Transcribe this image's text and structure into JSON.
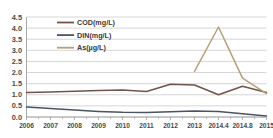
{
  "chart_data": {
    "type": "line",
    "title": "",
    "subtitle": "",
    "xlabel": "",
    "ylabel": "",
    "grid": "horizontal",
    "legend_position": "top-left-inside",
    "x": [
      "2006",
      "2007",
      "2008",
      "2009",
      "2010",
      "2011",
      "2012",
      "2013",
      "2014.4",
      "2014.8",
      "2015"
    ],
    "categories": [
      "2006",
      "2007",
      "2008",
      "2009",
      "2010",
      "2011",
      "2012",
      "2013",
      "2014.4",
      "2014.8",
      "2015"
    ],
    "ylim": [
      0.0,
      4.5
    ],
    "yticks": [
      "0.0",
      "0.5",
      "1.0",
      "1.5",
      "2.0",
      "2.5",
      "3.0",
      "3.5",
      "4.0",
      "4.5"
    ],
    "ytick_values": [
      0.0,
      0.5,
      1.0,
      1.5,
      2.0,
      2.5,
      3.0,
      3.5,
      4.0,
      4.5
    ],
    "series": [
      {
        "name": "COD(mg/L)",
        "color": "#6b4a3f",
        "values": [
          1.1,
          1.13,
          1.16,
          1.19,
          1.22,
          1.15,
          1.47,
          1.44,
          1.0,
          1.38,
          1.1
        ]
      },
      {
        "name": "DIN(mg/L)",
        "color": "#3f4a5c",
        "values": [
          0.45,
          0.38,
          0.31,
          0.25,
          0.21,
          0.2,
          0.24,
          0.27,
          0.25,
          0.15,
          0.05
        ]
      },
      {
        "name": "As(µg/L)",
        "color": "#b39a75",
        "values": [
          null,
          null,
          null,
          null,
          null,
          null,
          null,
          2.05,
          4.05,
          1.75,
          1.05
        ]
      }
    ]
  },
  "legend": {
    "items": [
      {
        "label": "COD(mg/L)",
        "color": "#6b4a3f"
      },
      {
        "label": "DIN(mg/L)",
        "color": "#3f4a5c"
      },
      {
        "label": "As(µg/L)",
        "color": "#b39a75"
      }
    ]
  },
  "colors": {
    "background": "#ffffff",
    "gridline": "#c9c9c9",
    "axis": "#9a9a9a",
    "tick_text": "#3d3d3d"
  }
}
